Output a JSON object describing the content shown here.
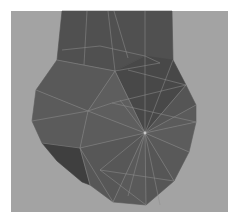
{
  "scene": {
    "description": "Low-poly 3D mesh (wireframe-on-shaded) of a rounded bulbous shape with a rectangular neck, viewport render",
    "colors": {
      "page_bg": "#ffffff",
      "viewport_bg": "#a3a3a3",
      "face_dark": "#4e4e4e",
      "face_mid": "#5a5a5a",
      "face_light": "#646464",
      "shadow_face": "#3c3c3c",
      "edge": "#8e8e8e"
    },
    "hub_vertex": [
      145,
      133
    ],
    "neck": [
      [
        62,
        11
      ],
      [
        172,
        11
      ],
      [
        173,
        60
      ],
      [
        160,
        63
      ],
      [
        145,
        56
      ],
      [
        115,
        71
      ],
      [
        84,
        65
      ],
      [
        57,
        60
      ]
    ],
    "body_outline": [
      [
        57,
        60
      ],
      [
        84,
        65
      ],
      [
        115,
        71
      ],
      [
        145,
        56
      ],
      [
        173,
        60
      ],
      [
        186,
        85
      ],
      [
        196,
        105
      ],
      [
        196,
        122
      ],
      [
        189,
        152
      ],
      [
        174,
        181
      ],
      [
        146,
        205
      ],
      [
        113,
        202
      ],
      [
        82,
        182
      ],
      [
        57,
        161
      ],
      [
        42,
        143
      ],
      [
        32,
        121
      ],
      [
        36,
        90
      ]
    ],
    "faces": [
      {
        "pts": [
          [
            62,
            11
          ],
          [
            172,
            11
          ],
          [
            173,
            60
          ],
          [
            160,
            63
          ],
          [
            145,
            56
          ],
          [
            115,
            71
          ],
          [
            84,
            65
          ],
          [
            57,
            60
          ]
        ],
        "fill": "#505050"
      },
      {
        "pts": [
          [
            115,
            71
          ],
          [
            145,
            56
          ],
          [
            173,
            60
          ],
          [
            186,
            85
          ],
          [
            145,
            133
          ]
        ],
        "fill": "#484848"
      },
      {
        "pts": [
          [
            57,
            60
          ],
          [
            84,
            65
          ],
          [
            115,
            71
          ],
          [
            88,
            111
          ],
          [
            36,
            90
          ]
        ],
        "fill": "#595959"
      },
      {
        "pts": [
          [
            36,
            90
          ],
          [
            88,
            111
          ],
          [
            80,
            148
          ],
          [
            42,
            143
          ],
          [
            32,
            121
          ]
        ],
        "fill": "#5b5b5b"
      },
      {
        "pts": [
          [
            42,
            143
          ],
          [
            80,
            148
          ],
          [
            90,
            185
          ],
          [
            82,
            182
          ],
          [
            57,
            161
          ]
        ],
        "fill": "#3f3f3f"
      },
      {
        "pts": [
          [
            115,
            71
          ],
          [
            145,
            133
          ],
          [
            88,
            111
          ]
        ],
        "fill": "#5e5e5e"
      },
      {
        "pts": [
          [
            88,
            111
          ],
          [
            145,
            133
          ],
          [
            80,
            148
          ]
        ],
        "fill": "#5c5c5c"
      },
      {
        "pts": [
          [
            80,
            148
          ],
          [
            145,
            133
          ],
          [
            113,
            202
          ],
          [
            90,
            185
          ]
        ],
        "fill": "#575757"
      },
      {
        "pts": [
          [
            145,
            133
          ],
          [
            146,
            205
          ],
          [
            113,
            202
          ]
        ],
        "fill": "#5a5a5a"
      },
      {
        "pts": [
          [
            145,
            133
          ],
          [
            174,
            181
          ],
          [
            146,
            205
          ]
        ],
        "fill": "#565656"
      },
      {
        "pts": [
          [
            145,
            133
          ],
          [
            189,
            152
          ],
          [
            174,
            181
          ]
        ],
        "fill": "#595959"
      },
      {
        "pts": [
          [
            145,
            133
          ],
          [
            196,
            122
          ],
          [
            189,
            152
          ]
        ],
        "fill": "#5c5c5c"
      },
      {
        "pts": [
          [
            145,
            133
          ],
          [
            196,
            105
          ],
          [
            196,
            122
          ]
        ],
        "fill": "#5b5b5b"
      },
      {
        "pts": [
          [
            145,
            133
          ],
          [
            186,
            85
          ],
          [
            196,
            105
          ]
        ],
        "fill": "#555555"
      }
    ],
    "edges": [
      [
        [
          87,
          11
        ],
        [
          84,
          65
        ]
      ],
      [
        [
          108,
          11
        ],
        [
          115,
          71
        ]
      ],
      [
        [
          114,
          11
        ],
        [
          128,
          58
        ]
      ],
      [
        [
          145,
          11
        ],
        [
          145,
          56
        ]
      ],
      [
        [
          62,
          50
        ],
        [
          100,
          46
        ]
      ],
      [
        [
          100,
          46
        ],
        [
          145,
          56
        ]
      ],
      [
        [
          145,
          56
        ],
        [
          160,
          63
        ]
      ],
      [
        [
          115,
          71
        ],
        [
          160,
          63
        ]
      ],
      [
        [
          57,
          60
        ],
        [
          115,
          71
        ]
      ],
      [
        [
          128,
          70
        ],
        [
          186,
          85
        ]
      ],
      [
        [
          36,
          90
        ],
        [
          88,
          111
        ]
      ],
      [
        [
          88,
          111
        ],
        [
          145,
          133
        ]
      ],
      [
        [
          88,
          111
        ],
        [
          115,
          71
        ]
      ],
      [
        [
          88,
          111
        ],
        [
          80,
          148
        ]
      ],
      [
        [
          88,
          111
        ],
        [
          112,
          103
        ]
      ],
      [
        [
          112,
          103
        ],
        [
          186,
          85
        ]
      ],
      [
        [
          112,
          103
        ],
        [
          196,
          122
        ]
      ],
      [
        [
          32,
          121
        ],
        [
          88,
          111
        ]
      ],
      [
        [
          42,
          143
        ],
        [
          80,
          148
        ]
      ],
      [
        [
          80,
          148
        ],
        [
          145,
          133
        ]
      ],
      [
        [
          80,
          148
        ],
        [
          90,
          185
        ]
      ],
      [
        [
          80,
          148
        ],
        [
          113,
          202
        ]
      ],
      [
        [
          145,
          133
        ],
        [
          115,
          71
        ]
      ],
      [
        [
          145,
          133
        ],
        [
          145,
          56
        ]
      ],
      [
        [
          145,
          133
        ],
        [
          173,
          60
        ]
      ],
      [
        [
          145,
          133
        ],
        [
          186,
          85
        ]
      ],
      [
        [
          145,
          133
        ],
        [
          196,
          105
        ]
      ],
      [
        [
          145,
          133
        ],
        [
          196,
          122
        ]
      ],
      [
        [
          145,
          133
        ],
        [
          189,
          152
        ]
      ],
      [
        [
          145,
          133
        ],
        [
          174,
          181
        ]
      ],
      [
        [
          145,
          133
        ],
        [
          160,
          205
        ]
      ],
      [
        [
          145,
          133
        ],
        [
          146,
          205
        ]
      ],
      [
        [
          145,
          133
        ],
        [
          113,
          202
        ]
      ],
      [
        [
          145,
          133
        ],
        [
          128,
          196
        ]
      ],
      [
        [
          145,
          133
        ],
        [
          100,
          170
        ]
      ],
      [
        [
          145,
          133
        ],
        [
          120,
          100
        ]
      ],
      [
        [
          100,
          170
        ],
        [
          174,
          181
        ]
      ],
      [
        [
          100,
          170
        ],
        [
          146,
          205
        ]
      ]
    ]
  }
}
